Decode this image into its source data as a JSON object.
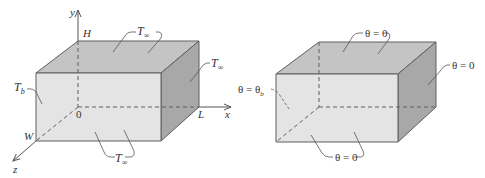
{
  "colors": {
    "top_face": "#c4c4c4",
    "front_face": "#e4e4e4",
    "right_face": "#a8a8a8",
    "edge": "#5e5e5e",
    "text": "#333333"
  },
  "left_figure": {
    "axes": {
      "x": "x",
      "y": "y",
      "z": "z"
    },
    "dims": {
      "height": "H",
      "length": "L",
      "width": "W",
      "origin": "0"
    },
    "labels": {
      "top": {
        "main": "T",
        "sub": "∞"
      },
      "right": {
        "main": "T",
        "sub": "∞"
      },
      "bottom": {
        "main": "T",
        "sub": "∞"
      },
      "base": {
        "main": "T",
        "sub": "b"
      }
    }
  },
  "right_figure": {
    "labels": {
      "top": "θ = 0",
      "right": "θ = 0",
      "bottom": "θ = 0",
      "base": {
        "main": "θ = θ",
        "sub": "b"
      }
    }
  }
}
